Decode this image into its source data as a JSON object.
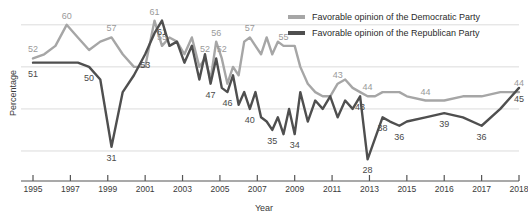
{
  "chart_data": {
    "type": "line",
    "title": "",
    "xlabel": "Year",
    "ylabel": "Percentage",
    "xlim": [
      1995,
      2018
    ],
    "ylim": [
      25,
      64
    ],
    "grid": true,
    "gridlines_y": [
      30,
      40,
      50,
      60
    ],
    "legend_position": "top-right",
    "x_tick_labels": [
      "1995",
      "1997",
      "1999",
      "2001",
      "2003",
      "2005",
      "2007",
      "2009",
      "2011",
      "2013",
      "2015",
      "2016",
      "2017",
      "2018"
    ],
    "x_tick_values": [
      1995,
      1997,
      1999,
      2001,
      2003,
      2005,
      2007,
      2009,
      2011,
      2013,
      2015,
      2016,
      2017,
      2018
    ],
    "colors": {
      "democratic": "#a6a6a6",
      "republican": "#4f4f4f",
      "gridline": "#dcdcdc",
      "axis": "#555555",
      "text": "#3a3a3a"
    },
    "series": [
      {
        "name": "Favorable opinion of the Democratic Party",
        "color": "#a6a6a6",
        "x": [
          1995.0,
          1995.6,
          1996.2,
          1996.8,
          1997.4,
          1998.0,
          1998.6,
          1999.2,
          1999.8,
          2000.4,
          2001.0,
          2001.5,
          2001.9,
          2002.3,
          2002.7,
          2003.1,
          2003.5,
          2003.9,
          2004.2,
          2004.5,
          2004.8,
          2005.1,
          2005.4,
          2005.7,
          2006.0,
          2006.3,
          2006.6,
          2006.9,
          2007.2,
          2007.5,
          2007.8,
          2008.1,
          2008.4,
          2008.7,
          2009.0,
          2009.3,
          2009.7,
          2010.1,
          2010.5,
          2010.9,
          2011.3,
          2011.7,
          2012.1,
          2012.5,
          2012.9,
          2013.3,
          2013.7,
          2014.1,
          2014.6,
          2015.0,
          2015.5,
          2016.0,
          2016.5,
          2017.0,
          2017.5,
          2018.0
        ],
        "y": [
          52,
          53,
          55,
          60,
          57,
          54,
          56,
          57,
          53,
          50,
          50,
          61,
          55,
          57,
          56,
          53,
          57,
          50,
          52,
          47,
          56,
          52,
          46,
          50,
          48,
          56,
          57,
          55,
          53,
          57,
          53,
          56,
          55,
          55,
          55,
          50,
          46,
          44,
          43,
          43,
          46,
          47,
          45,
          44,
          43,
          43,
          44,
          44,
          44,
          43,
          42,
          42,
          43,
          43,
          44,
          44
        ]
      },
      {
        "name": "Favorable opinion of the Republican Party",
        "color": "#4f4f4f",
        "x": [
          1995.0,
          1995.6,
          1996.2,
          1996.8,
          1997.4,
          1998.0,
          1998.6,
          1999.2,
          1999.8,
          2000.4,
          2001.0,
          2001.5,
          2001.9,
          2002.3,
          2002.7,
          2003.1,
          2003.5,
          2003.9,
          2004.2,
          2004.5,
          2004.8,
          2005.1,
          2005.4,
          2005.7,
          2006.0,
          2006.3,
          2006.6,
          2006.9,
          2007.2,
          2007.5,
          2007.8,
          2008.1,
          2008.4,
          2008.7,
          2009.0,
          2009.3,
          2009.7,
          2010.1,
          2010.5,
          2010.9,
          2011.3,
          2011.7,
          2012.1,
          2012.5,
          2012.9,
          2013.3,
          2013.7,
          2014.1,
          2014.6,
          2015.0,
          2015.5,
          2016.0,
          2016.5,
          2017.0,
          2017.5,
          2018.0
        ],
        "y": [
          51,
          51,
          51,
          51,
          51,
          50,
          47,
          31,
          44,
          48,
          53,
          58,
          61,
          55,
          56,
          51,
          55,
          47,
          53,
          46,
          52,
          45,
          44,
          48,
          41,
          44,
          40,
          44,
          38,
          37,
          35,
          38,
          34,
          40,
          34,
          44,
          37,
          42,
          40,
          43,
          38,
          42,
          40,
          43,
          28,
          33,
          38,
          37,
          36,
          37,
          38,
          39,
          38,
          36,
          40,
          45
        ]
      }
    ],
    "point_labels_democratic": [
      {
        "value": "52",
        "x": 1995.0,
        "y": 52
      },
      {
        "value": "60",
        "x": 1996.8,
        "y": 60
      },
      {
        "value": "57",
        "x": 1999.2,
        "y": 57
      },
      {
        "value": "61",
        "x": 2001.5,
        "y": 61
      },
      {
        "value": "55",
        "x": 2001.9,
        "y": 55
      },
      {
        "value": "52",
        "x": 2004.2,
        "y": 52
      },
      {
        "value": "56",
        "x": 2004.8,
        "y": 56
      },
      {
        "value": "52",
        "x": 2005.1,
        "y": 52
      },
      {
        "value": "57",
        "x": 2006.6,
        "y": 57
      },
      {
        "value": "55",
        "x": 2008.4,
        "y": 55
      },
      {
        "value": "43",
        "x": 2011.3,
        "y": 46
      },
      {
        "value": "44",
        "x": 2012.9,
        "y": 43
      },
      {
        "value": "44",
        "x": 2015.5,
        "y": 42
      },
      {
        "value": "44",
        "x": 2018.0,
        "y": 44
      }
    ],
    "point_labels_republican": [
      {
        "value": "51",
        "x": 1995.0,
        "y": 51
      },
      {
        "value": "50",
        "x": 1998.0,
        "y": 50
      },
      {
        "value": "31",
        "x": 1999.2,
        "y": 31
      },
      {
        "value": "53",
        "x": 2001.0,
        "y": 53
      },
      {
        "value": "61",
        "x": 2001.9,
        "y": 61
      },
      {
        "value": "47",
        "x": 2004.5,
        "y": 46
      },
      {
        "value": "46",
        "x": 2005.4,
        "y": 44
      },
      {
        "value": "40",
        "x": 2006.6,
        "y": 40
      },
      {
        "value": "35",
        "x": 2007.8,
        "y": 35
      },
      {
        "value": "34",
        "x": 2009.0,
        "y": 34
      },
      {
        "value": "43",
        "x": 2012.5,
        "y": 43
      },
      {
        "value": "28",
        "x": 2012.9,
        "y": 28
      },
      {
        "value": "38",
        "x": 2013.7,
        "y": 38
      },
      {
        "value": "36",
        "x": 2014.6,
        "y": 36
      },
      {
        "value": "39",
        "x": 2016.0,
        "y": 39
      },
      {
        "value": "36",
        "x": 2017.0,
        "y": 36
      },
      {
        "value": "45",
        "x": 2018.0,
        "y": 45
      }
    ]
  },
  "legend": {
    "items": [
      {
        "label": "Favorable opinion of the Democratic Party",
        "color": "#a6a6a6"
      },
      {
        "label": "Favorable opinion of the Republican Party",
        "color": "#4f4f4f"
      }
    ]
  }
}
